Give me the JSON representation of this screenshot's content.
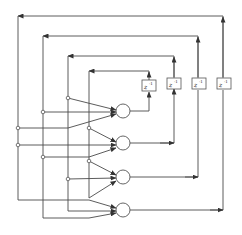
{
  "diagram": {
    "type": "signal-flow / lattice filter block diagram",
    "delay_label": "z",
    "delay_exponent": "-1",
    "delays": [
      {
        "id": "d1",
        "label": "z^-1"
      },
      {
        "id": "d2",
        "label": "z^-1"
      },
      {
        "id": "d3",
        "label": "z^-1"
      },
      {
        "id": "d4",
        "label": "z^-1"
      }
    ],
    "summation_nodes": [
      {
        "id": "s1"
      },
      {
        "id": "s2"
      },
      {
        "id": "s3"
      },
      {
        "id": "s4"
      }
    ],
    "colors": {
      "line": "#4a4a4a",
      "background": "#ffffff"
    }
  }
}
